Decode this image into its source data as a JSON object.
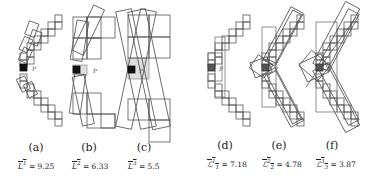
{
  "figure": {
    "panels": [
      {
        "id": "a",
        "caption": "(a)",
        "metric_symbol": "L",
        "metric_sup": "1",
        "metric_sub": "",
        "metric_value": "= 9.25",
        "point_label": "P"
      },
      {
        "id": "b",
        "caption": "(b)",
        "metric_symbol": "L",
        "metric_sup": "2",
        "metric_sub": "",
        "metric_value": "= 6.33",
        "point_label": "P"
      },
      {
        "id": "c",
        "caption": "(c)",
        "metric_symbol": "L",
        "metric_sup": "3",
        "metric_sub": "",
        "metric_value": "= 5.5",
        "point_label": "P"
      },
      {
        "id": "d",
        "caption": "(d)",
        "metric_symbol": "ℒ",
        "metric_sup": "1",
        "metric_sub": "1",
        "metric_value": "= 7.18",
        "point_label": "P"
      },
      {
        "id": "e",
        "caption": "(e)",
        "metric_symbol": "ℒ",
        "metric_sup": "2",
        "metric_sub": "2",
        "metric_value": "= 4.78",
        "point_label": "P"
      },
      {
        "id": "f",
        "caption": "(f)",
        "metric_symbol": "ℒ",
        "metric_sup": "3",
        "metric_sub": "3",
        "metric_value": "= 3.87",
        "point_label": "P"
      }
    ],
    "colors": {
      "line": "#555555",
      "focus_pixel": "#111111",
      "highlight": "#dddddd"
    }
  }
}
